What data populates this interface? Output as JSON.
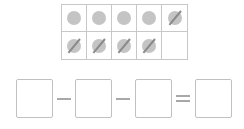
{
  "ten_frame": {
    "cells": [
      {
        "filled": true,
        "crossed": false
      },
      {
        "filled": true,
        "crossed": false
      },
      {
        "filled": true,
        "crossed": false
      },
      {
        "filled": true,
        "crossed": false
      },
      {
        "filled": true,
        "crossed": true
      },
      {
        "filled": true,
        "crossed": true
      },
      {
        "filled": true,
        "crossed": true
      },
      {
        "filled": true,
        "crossed": true
      },
      {
        "filled": true,
        "crossed": true
      },
      {
        "filled": false,
        "crossed": false
      }
    ]
  },
  "equation": {
    "boxes": [
      "",
      "",
      "",
      ""
    ],
    "operators": [
      "minus",
      "minus",
      "equals"
    ]
  },
  "colors": {
    "dot": "#c4c4c4",
    "slash": "#8a8a8a",
    "border": "#c8c8c8"
  }
}
